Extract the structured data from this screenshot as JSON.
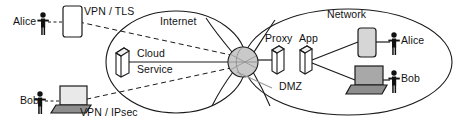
{
  "diagram": {
    "zones": [
      {
        "name": "internet-zone",
        "label": "Internet"
      },
      {
        "name": "network-zone",
        "label": "Network"
      }
    ],
    "junction": {
      "name": "gateway-sphere",
      "label": "",
      "fill": "#c9c9c9"
    },
    "left_side": {
      "users": [
        {
          "name": "alice",
          "label": "Alice",
          "device": "tablet",
          "tunnel": "VPN / TLS"
        },
        {
          "name": "bob",
          "label": "Bob",
          "device": "laptop",
          "tunnel": "VPN / IPsec"
        }
      ],
      "service": {
        "label_line1": "Cloud",
        "label_line2": "Service",
        "icon": "server-box"
      }
    },
    "right_side": {
      "servers": [
        {
          "name": "proxy-server",
          "label": "Proxy",
          "icon": "server-box"
        },
        {
          "name": "app-server",
          "label": "App",
          "icon": "server-box"
        }
      ],
      "segment": {
        "label": "DMZ"
      },
      "clients": [
        {
          "name": "alice-internal",
          "label": "Alice",
          "device": "tablet"
        },
        {
          "name": "bob-internal",
          "label": "Bob",
          "device": "laptop"
        }
      ]
    },
    "colors": {
      "stroke": "#1a1a1a",
      "sphere_fill": "#c9c9c9",
      "device_fill": "#d6d6d6",
      "laptop_base": "#8e8e8e",
      "white": "#ffffff",
      "text": "#121212"
    }
  }
}
